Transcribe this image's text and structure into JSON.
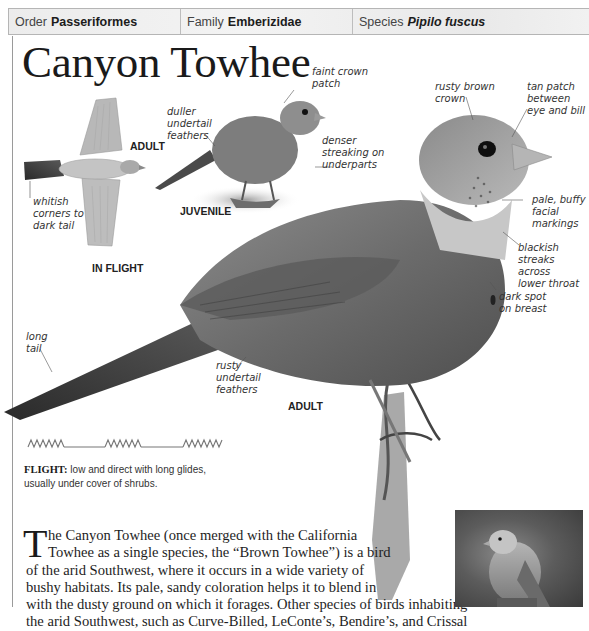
{
  "taxonomy": {
    "order_label": "Order",
    "order_value": "Passeriformes",
    "family_label": "Family",
    "family_value": "Emberizidae",
    "species_label": "Species",
    "species_value": "Pipilo fuscus"
  },
  "title": "Canyon Towhee",
  "illustrations": {
    "in_flight": {
      "caption": "IN FLIGHT",
      "age_label": "ADULT",
      "annotations": [
        "whitish\ncorners to\ndark tail"
      ]
    },
    "juvenile": {
      "caption": "JUVENILE",
      "annotations": {
        "crown": "faint crown\npatch",
        "undertail": "duller\nundertail\nfeathers",
        "underparts": "denser\nstreaking on\nunderparts"
      }
    },
    "adult": {
      "caption": "ADULT",
      "annotations": {
        "crown": "rusty brown\ncrown",
        "tan_patch": "tan patch\nbetween\neye and bill",
        "facial": "pale, buffy\nfacial\nmarkings",
        "throat": "blackish\nstreaks across\nlower throat",
        "breast": "dark spot\non breast",
        "tail": "long\ntail",
        "undertail": "rusty\nundertail\nfeathers"
      }
    }
  },
  "flight": {
    "label": "FLIGHT:",
    "description_line1": "low and direct with long glides,",
    "description_line2": "usually under cover of shrubs."
  },
  "body": {
    "drop_cap": "T",
    "lines": [
      "he Canyon Towhee (once merged with the California",
      "Towhee as a single species, the “Brown Towhee”) is a bird",
      "of the arid Southwest, where it occurs in a wide variety of",
      "bushy habitats. Its pale, sandy coloration helps it to blend in",
      "with the dusty ground on which it forages. Other species of birds inhabiting",
      "the arid Southwest, such as Curve-Billed, LeConte’s, Bendire’s, and Crissal"
    ]
  },
  "colors": {
    "header_bg": "#efefef",
    "header_border": "#b5b5b5",
    "text": "#1a1a1a",
    "annotation": "#333333"
  }
}
